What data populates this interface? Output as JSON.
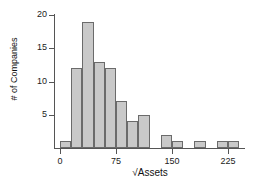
{
  "chart_data": {
    "type": "bar",
    "title": "",
    "subtitle": "",
    "xlabel": "√Assets",
    "ylabel": "# of Companies",
    "xlim": [
      -7,
      248
    ],
    "ylim": [
      0,
      21
    ],
    "grid": false,
    "legend": null,
    "bin_width": 15,
    "x_ticks": [
      0,
      75,
      150,
      225
    ],
    "x_tick_labels": [
      "0",
      "75",
      "150",
      "225"
    ],
    "y_ticks": [
      5,
      10,
      15,
      20
    ],
    "y_tick_labels": [
      "5",
      "10",
      "15",
      "20"
    ],
    "bins": [
      {
        "start": 0,
        "end": 15,
        "label": "0–15",
        "value": 1
      },
      {
        "start": 15,
        "end": 30,
        "label": "15–30",
        "value": 12
      },
      {
        "start": 30,
        "end": 45,
        "label": "30–45",
        "value": 19
      },
      {
        "start": 45,
        "end": 60,
        "label": "45–60",
        "value": 13
      },
      {
        "start": 60,
        "end": 75,
        "label": "60–75",
        "value": 12
      },
      {
        "start": 75,
        "end": 90,
        "label": "75–90",
        "value": 7
      },
      {
        "start": 90,
        "end": 105,
        "label": "90–105",
        "value": 4
      },
      {
        "start": 105,
        "end": 120,
        "label": "105–120",
        "value": 5
      },
      {
        "start": 120,
        "end": 135,
        "label": "120–135",
        "value": 0
      },
      {
        "start": 135,
        "end": 150,
        "label": "135–150",
        "value": 2
      },
      {
        "start": 150,
        "end": 165,
        "label": "150–165",
        "value": 1
      },
      {
        "start": 165,
        "end": 180,
        "label": "165–180",
        "value": 0
      },
      {
        "start": 180,
        "end": 195,
        "label": "180–195",
        "value": 1
      },
      {
        "start": 195,
        "end": 210,
        "label": "195–210",
        "value": 0
      },
      {
        "start": 210,
        "end": 225,
        "label": "210–225",
        "value": 1
      },
      {
        "start": 225,
        "end": 240,
        "label": "225–240",
        "value": 1
      }
    ],
    "categories": [
      "0–15",
      "15–30",
      "30–45",
      "45–60",
      "60–75",
      "75–90",
      "90–105",
      "105–120",
      "120–135",
      "135–150",
      "150–165",
      "165–180",
      "180–195",
      "195–210",
      "210–225",
      "225–240"
    ],
    "values": [
      1,
      12,
      19,
      13,
      12,
      7,
      4,
      5,
      0,
      2,
      1,
      0,
      1,
      0,
      1,
      1
    ],
    "colors": {
      "bar_fill": "#c9c9c9",
      "bar_stroke": "#6b6b6b",
      "axis": "#555555",
      "text": "#111111",
      "background": "#ffffff"
    }
  }
}
